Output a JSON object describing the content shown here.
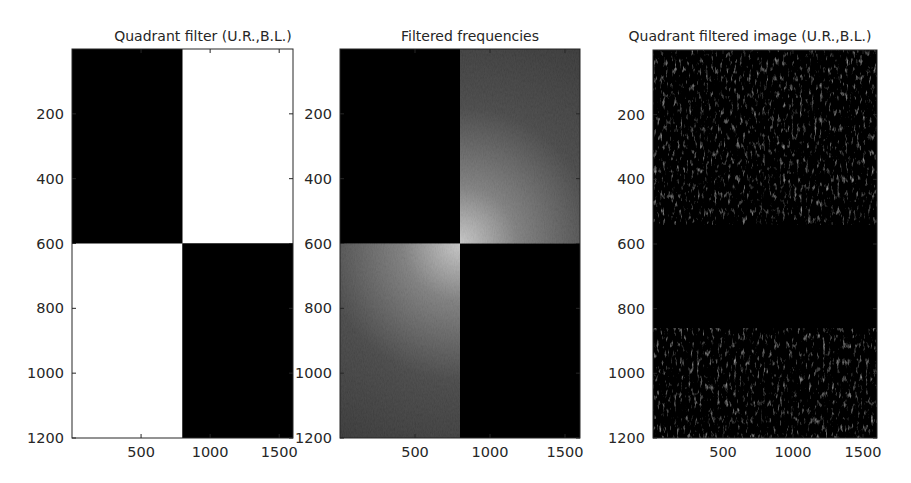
{
  "chart_data": [
    {
      "type": "heatmap",
      "title": "Quadrant filter (U.R.,B.L.)",
      "xlim": [
        0,
        1600
      ],
      "ylim": [
        0,
        1200
      ],
      "y_reversed": true,
      "xticks": [
        500,
        1000,
        1500
      ],
      "yticks": [
        200,
        400,
        600,
        800,
        1000,
        1200
      ],
      "quadrant_split": {
        "x": 800,
        "y": 600
      },
      "quadrants": {
        "upper_left": 0,
        "upper_right": 1,
        "lower_left": 1,
        "lower_right": 0
      },
      "colormap": "gray",
      "description": "Binary mask: white (pass) upper-right and bottom-left quadrants, black elsewhere"
    },
    {
      "type": "heatmap",
      "title": "Filtered frequencies",
      "xlim": [
        0,
        1600
      ],
      "ylim": [
        0,
        1200
      ],
      "y_reversed": true,
      "xticks": [
        500,
        1000,
        1500
      ],
      "yticks": [
        200,
        400,
        600,
        800,
        1000,
        1200
      ],
      "quadrant_split": {
        "x": 800,
        "y": 600
      },
      "quadrants": {
        "upper_left": 0,
        "upper_right": 1,
        "lower_left": 1,
        "lower_right": 0
      },
      "colormap": "gray",
      "peak_intensity": 0.78,
      "edge_intensity": 0.22,
      "description": "Masked log-magnitude spectrum, brightest near the center and fading outward in passed quadrants"
    },
    {
      "type": "heatmap",
      "title": "Quadrant filtered image (U.R.,B.L.)",
      "xlim": [
        0,
        1600
      ],
      "ylim": [
        0,
        1200
      ],
      "y_reversed": true,
      "xticks": [
        500,
        1000,
        1500
      ],
      "yticks": [
        200,
        400,
        600,
        800,
        1000,
        1200
      ],
      "colormap": "gray",
      "texture_bands": [
        [
          0,
          540
        ],
        [
          860,
          1200
        ]
      ],
      "description": "Mostly black image with sparse bright diagonal edge streaks in the upper and lower bands, dark middle band"
    }
  ]
}
